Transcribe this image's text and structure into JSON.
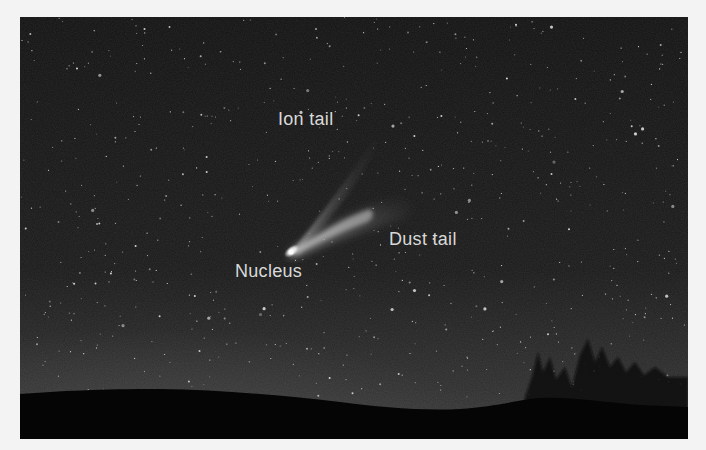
{
  "figure": {
    "colors": {
      "page_background": "#f3f3f3",
      "sky_top": "#121212",
      "sky_horizon": "#3a3a3a",
      "ground": "#050505",
      "label_text": "#d9d9d9",
      "comet_head": "#ffffff"
    },
    "labels": [
      {
        "id": "ion-tail",
        "text": "Ion tail",
        "x": 258,
        "y": 93
      },
      {
        "id": "dust-tail",
        "text": "Dust tail",
        "x": 369,
        "y": 213
      },
      {
        "id": "nucleus",
        "text": "Nucleus",
        "x": 215,
        "y": 245
      }
    ]
  }
}
